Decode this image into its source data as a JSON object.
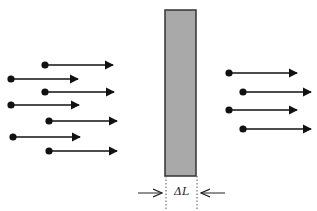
{
  "diagram": {
    "slab": {
      "x": 165,
      "y": 10,
      "width": 31,
      "height": 166,
      "fill": "#a9a9a9",
      "stroke": "#333333"
    },
    "thickness_label": "ΔL",
    "incoming_arrows": [
      {
        "x1": 45,
        "y": 65,
        "x2": 113
      },
      {
        "x1": 11,
        "y": 79,
        "x2": 78
      },
      {
        "x1": 45,
        "y": 92,
        "x2": 114
      },
      {
        "x1": 11,
        "y": 105,
        "x2": 79
      },
      {
        "x1": 49,
        "y": 121,
        "x2": 117
      },
      {
        "x1": 13,
        "y": 137,
        "x2": 80
      },
      {
        "x1": 49,
        "y": 151,
        "x2": 117
      }
    ],
    "outgoing_arrows": [
      {
        "x1": 229,
        "y": 73,
        "x2": 297
      },
      {
        "x1": 243,
        "y": 92,
        "x2": 311
      },
      {
        "x1": 229,
        "y": 110,
        "x2": 297
      },
      {
        "x1": 243,
        "y": 129,
        "x2": 311
      }
    ],
    "colors": {
      "arrow": "#111111",
      "slab": "#a9a9a9",
      "dotted": "#555555"
    }
  }
}
